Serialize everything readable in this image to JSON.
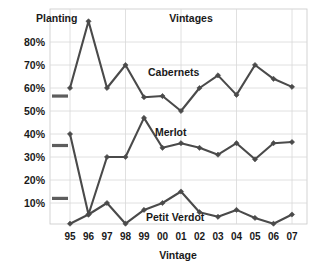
{
  "chart_data": {
    "type": "line",
    "title": "Vintages",
    "xlabel": "Vintage",
    "ylabel": "",
    "categories": [
      "95",
      "96",
      "97",
      "98",
      "99",
      "00",
      "01",
      "02",
      "03",
      "04",
      "05",
      "06",
      "07"
    ],
    "ylim": [
      0,
      90
    ],
    "yticks": [
      10,
      20,
      30,
      40,
      50,
      60,
      70,
      80
    ],
    "ytick_labels": [
      "10%",
      "20%",
      "30%",
      "40%",
      "50%",
      "60%",
      "70%",
      "80%"
    ],
    "grid": true,
    "legend_position": "inline-annotations",
    "series": [
      {
        "name": "Cabernets",
        "values": [
          60,
          89,
          60,
          70,
          56,
          56.5,
          50,
          60,
          65.5,
          57,
          70,
          64,
          60.5
        ]
      },
      {
        "name": "Merlot",
        "values": [
          40,
          5,
          30,
          30,
          47,
          34,
          36,
          34,
          31,
          36,
          29,
          36,
          36.5
        ]
      },
      {
        "name": "Petit Verdot",
        "values": [
          1,
          5,
          10,
          1,
          7,
          10,
          15,
          6,
          4,
          7,
          3.5,
          1,
          5
        ]
      }
    ],
    "annotations": [
      {
        "text": "Planting",
        "kind": "reference-group-label"
      },
      {
        "text": "Cabernets",
        "kind": "series-label"
      },
      {
        "text": "Merlot",
        "kind": "series-label"
      },
      {
        "text": "Petit Verdot",
        "kind": "series-label"
      }
    ],
    "reference_lines": [
      {
        "label": "Planting",
        "series": "Cabernets",
        "value": 56.5
      },
      {
        "label": "Planting",
        "series": "Merlot",
        "value": 35
      },
      {
        "label": "Planting",
        "series": "Petit Verdot",
        "value": 12
      }
    ]
  }
}
